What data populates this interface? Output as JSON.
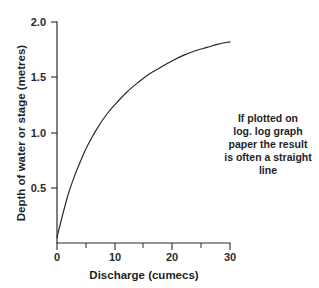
{
  "chart_data": {
    "type": "line",
    "title": "",
    "subtitle": "",
    "xlabel": "Discharge (cumecs)",
    "ylabel": "Depth of water or stage (metres)",
    "xlim": [
      0,
      30
    ],
    "ylim": [
      0,
      2.0
    ],
    "grid": false,
    "legend": null,
    "x_ticks_major": [
      0,
      10,
      20,
      30
    ],
    "x_tick_labels": [
      "0",
      "10",
      "20",
      "30"
    ],
    "x_ticks_minor": [
      5,
      15,
      25
    ],
    "y_ticks_major": [
      0.5,
      1.0,
      1.5,
      2.0
    ],
    "y_tick_labels": [
      "0.5",
      "1.0",
      "1.5",
      "2.0"
    ],
    "series": [
      {
        "name": "rating-curve",
        "color": "#242424",
        "x": [
          0,
          1,
          2,
          3,
          4,
          5,
          6,
          7,
          8,
          9,
          10,
          12,
          14,
          16,
          18,
          20,
          22,
          24,
          26,
          28,
          30
        ],
        "values": [
          0.05,
          0.26,
          0.45,
          0.6,
          0.73,
          0.85,
          0.95,
          1.04,
          1.12,
          1.19,
          1.25,
          1.36,
          1.45,
          1.53,
          1.59,
          1.65,
          1.7,
          1.74,
          1.77,
          1.8,
          1.82
        ]
      }
    ],
    "annotations": [
      {
        "name": "log-log-note",
        "lines": [
          "If plotted on",
          "log. log graph",
          "paper the result",
          "is often a straight",
          "line"
        ],
        "x": 268,
        "y": 118,
        "align": "center"
      }
    ],
    "colors": {
      "background": "#ffffff",
      "axis": "#2b2b2b",
      "curve": "#242424",
      "text": "#1f1f1f"
    }
  }
}
